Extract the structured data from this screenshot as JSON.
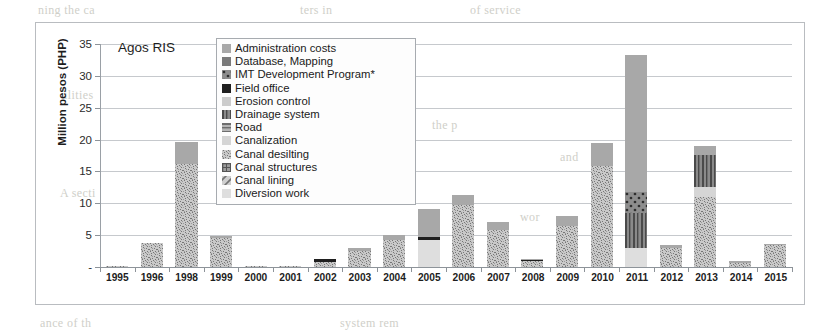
{
  "chart_data": {
    "type": "bar",
    "stacked": true,
    "title": "Agos RIS",
    "xlabel": "",
    "ylabel": "Million pesos (PHP)",
    "ylim": [
      0,
      35
    ],
    "yticks": [
      "-",
      "5",
      "10",
      "15",
      "20",
      "25",
      "30",
      "35"
    ],
    "ytick_values": [
      0,
      5,
      10,
      15,
      20,
      25,
      30,
      35
    ],
    "grid": true,
    "legend_position": "inside-top-center",
    "categories": [
      "1995",
      "1996",
      "1998",
      "1999",
      "2000",
      "2001",
      "2002",
      "2003",
      "2004",
      "2005",
      "2006",
      "2007",
      "2008",
      "2009",
      "2010",
      "2011",
      "2012",
      "2013",
      "2014",
      "2015"
    ],
    "series": [
      {
        "name": "Diversion work",
        "values": [
          0.0,
          0.0,
          0.0,
          0.0,
          0.0,
          0.0,
          0.0,
          0.0,
          0.0,
          4.3,
          0.0,
          0.0,
          0.0,
          0.0,
          0.0,
          3.0,
          0.0,
          0.0,
          0.0,
          0.0
        ]
      },
      {
        "name": "Canal lining",
        "values": [
          0.0,
          0.0,
          0.0,
          0.0,
          0.0,
          0.0,
          0.0,
          0.0,
          0.0,
          0.0,
          0.0,
          0.0,
          0.0,
          0.0,
          0.0,
          0.0,
          0.0,
          0.0,
          0.0,
          0.0
        ]
      },
      {
        "name": "Canal structures",
        "values": [
          0.0,
          0.0,
          0.0,
          0.0,
          0.0,
          0.0,
          0.0,
          0.0,
          0.0,
          0.0,
          0.0,
          0.0,
          0.0,
          0.0,
          0.0,
          0.0,
          0.0,
          0.0,
          0.0,
          0.0
        ]
      },
      {
        "name": "Canal desilting",
        "values": [
          0.2,
          3.8,
          16.2,
          4.6,
          0.2,
          0.2,
          0.8,
          2.5,
          4.2,
          0.0,
          9.8,
          5.8,
          0.9,
          6.5,
          15.8,
          0.0,
          3.0,
          11.0,
          0.7,
          3.4
        ]
      },
      {
        "name": "Canalization",
        "values": [
          0.0,
          0.0,
          0.0,
          0.0,
          0.0,
          0.0,
          0.0,
          0.0,
          0.0,
          0.0,
          0.0,
          0.0,
          0.0,
          0.0,
          0.0,
          0.0,
          0.0,
          1.6,
          0.0,
          0.0
        ]
      },
      {
        "name": "Road",
        "values": [
          0.0,
          0.0,
          0.0,
          0.0,
          0.0,
          0.0,
          0.0,
          0.0,
          0.0,
          0.0,
          0.0,
          0.0,
          0.0,
          0.0,
          0.0,
          0.0,
          0.0,
          0.0,
          0.0,
          0.0
        ]
      },
      {
        "name": "Drainage system",
        "values": [
          0.0,
          0.0,
          0.0,
          0.0,
          0.0,
          0.0,
          0.0,
          0.0,
          0.0,
          0.0,
          0.0,
          0.0,
          0.0,
          0.0,
          0.0,
          5.5,
          0.0,
          5.0,
          0.0,
          0.0
        ]
      },
      {
        "name": "Erosion control",
        "values": [
          0.0,
          0.0,
          0.0,
          0.0,
          0.0,
          0.0,
          0.0,
          0.0,
          0.0,
          0.0,
          0.0,
          0.0,
          0.0,
          0.0,
          0.0,
          0.0,
          0.0,
          0.0,
          0.0,
          0.0
        ]
      },
      {
        "name": "Field office",
        "values": [
          0.0,
          0.0,
          0.0,
          0.0,
          0.0,
          0.0,
          0.4,
          0.0,
          0.0,
          0.4,
          0.0,
          0.0,
          0.2,
          0.0,
          0.0,
          0.0,
          0.0,
          0.0,
          0.0,
          0.0
        ]
      },
      {
        "name": "IMT Development Program*",
        "values": [
          0.0,
          0.0,
          0.0,
          0.0,
          0.0,
          0.0,
          0.0,
          0.0,
          0.0,
          0.0,
          0.0,
          0.0,
          0.0,
          0.0,
          0.0,
          3.2,
          0.0,
          0.0,
          0.0,
          0.0
        ]
      },
      {
        "name": "Database, Mapping",
        "values": [
          0.0,
          0.0,
          0.0,
          0.0,
          0.0,
          0.0,
          0.0,
          0.0,
          0.0,
          0.0,
          0.0,
          0.0,
          0.0,
          0.0,
          0.0,
          0.0,
          0.0,
          0.0,
          0.0,
          0.0
        ]
      },
      {
        "name": "Administration costs",
        "values": [
          0.0,
          0.0,
          3.5,
          0.3,
          0.0,
          0.0,
          0.0,
          0.5,
          0.8,
          4.4,
          1.5,
          1.3,
          0.2,
          1.5,
          3.6,
          21.6,
          0.4,
          1.4,
          0.2,
          0.2
        ]
      }
    ],
    "totals": [
      0.2,
      3.8,
      19.7,
      4.9,
      0.2,
      0.2,
      1.2,
      3.0,
      5.0,
      9.1,
      11.3,
      7.1,
      1.3,
      8.0,
      19.4,
      33.3,
      3.4,
      19.0,
      0.9,
      3.6
    ]
  },
  "legend": {
    "items": [
      {
        "label": "Administration costs",
        "pattern": "solid-mid",
        "color": "#a8a8a8"
      },
      {
        "label": "Database, Mapping",
        "pattern": "solid-dark",
        "color": "#7a7a7a"
      },
      {
        "label": "IMT Development Program*",
        "pattern": "dots-dark",
        "color": "#6f6f6f"
      },
      {
        "label": "Field office",
        "pattern": "solid-black",
        "color": "#1f1f1f"
      },
      {
        "label": "Erosion control",
        "pattern": "solid-light",
        "color": "#cccccc"
      },
      {
        "label": "Drainage system",
        "pattern": "vstripe-dark",
        "color": "#6b6b6b"
      },
      {
        "label": "Road",
        "pattern": "hstripe",
        "color": "#8f8f8f"
      },
      {
        "label": "Canalization",
        "pattern": "solid-xlight",
        "color": "#d5d5d5"
      },
      {
        "label": "Canal desilting",
        "pattern": "speckle",
        "color": "#b0b0b0"
      },
      {
        "label": "Canal structures",
        "pattern": "grid-dark",
        "color": "#7e7e7e"
      },
      {
        "label": "Canal lining",
        "pattern": "diag",
        "color": "#bdbdbd"
      },
      {
        "label": "Diversion work",
        "pattern": "solid-pale",
        "color": "#dedede"
      }
    ]
  },
  "ghost_text": [
    {
      "text": "ning the ca",
      "x": 38,
      "y": 3
    },
    {
      "text": "ters in",
      "x": 300,
      "y": 3
    },
    {
      "text": "of service",
      "x": 470,
      "y": 3
    },
    {
      "text": "ilities",
      "x": 64,
      "y": 88
    },
    {
      "text": "the p",
      "x": 432,
      "y": 118
    },
    {
      "text": "and",
      "x": 560,
      "y": 150
    },
    {
      "text": "A secti",
      "x": 60,
      "y": 186
    },
    {
      "text": "wor",
      "x": 520,
      "y": 210
    },
    {
      "text": "ance of th",
      "x": 40,
      "y": 316
    },
    {
      "text": "system rem",
      "x": 340,
      "y": 316
    }
  ]
}
